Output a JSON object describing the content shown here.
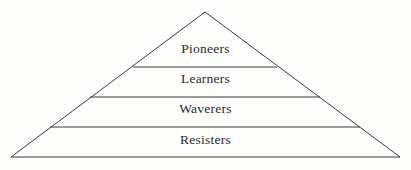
{
  "figure": {
    "type": "pyramid-diagram",
    "background_color": "#fefefc",
    "line_color": "#3a3a3a",
    "text_color": "#2b2b2b"
  },
  "pyramid": {
    "apex": {
      "x": 205,
      "y": 12
    },
    "base_left": {
      "x": 11,
      "y": 157
    },
    "base_right": {
      "x": 400,
      "y": 157
    },
    "tiers": [
      {
        "id": "pioneers",
        "label": "Pioneers",
        "rank": 1,
        "position": "top",
        "divider_y": 67,
        "divider_x_start": 133,
        "divider_x_end": 277
      },
      {
        "id": "learners",
        "label": "Learners",
        "rank": 2,
        "position": "upper-middle",
        "divider_y": 97,
        "divider_x_start": 90,
        "divider_x_end": 320
      },
      {
        "id": "waverers",
        "label": "Waverers",
        "rank": 3,
        "position": "lower-middle",
        "divider_y": 127,
        "divider_x_start": 50,
        "divider_x_end": 360
      },
      {
        "id": "resisters",
        "label": "Resisters",
        "rank": 4,
        "position": "base",
        "divider_y": 157,
        "divider_x_start": 11,
        "divider_x_end": 400
      }
    ]
  }
}
